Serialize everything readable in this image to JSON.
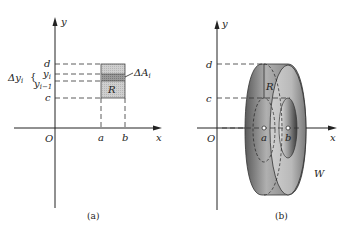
{
  "figure_a": {
    "caption": "(a)",
    "axis_y_label": "y",
    "axis_x_label": "x",
    "origin_label": "O",
    "tick_d": "d",
    "tick_yi": "y",
    "tick_yi_sub": "i",
    "tick_yi1": "y",
    "tick_yi1_sub": "i−1",
    "tick_c": "c",
    "delta_y_label": "Δy",
    "delta_y_sub": "i",
    "delta_y_brace": "{",
    "tick_a": "a",
    "tick_b": "b",
    "region_label": "R",
    "delta_a_label": "ΔA",
    "delta_a_sub": "i"
  },
  "figure_b": {
    "caption": "(b)",
    "axis_y_label": "y",
    "axis_x_label": "x",
    "origin_label": "O",
    "tick_d": "d",
    "tick_c": "c",
    "tick_a": "a",
    "tick_b": "b",
    "region_label": "R",
    "solid_label": "W"
  },
  "colors": {
    "region_fill": "#c8c8c8",
    "strip_fill": "#8a8a8a",
    "ring_dark": "#6a6a6a",
    "ring_light": "#d8d8d8"
  }
}
